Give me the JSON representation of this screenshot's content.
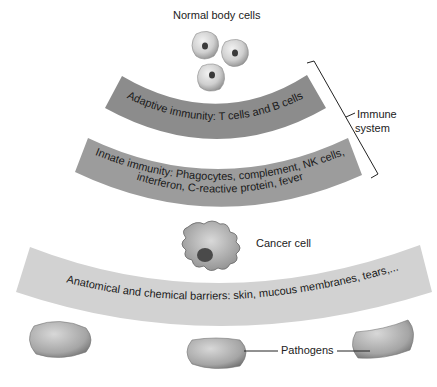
{
  "labels": {
    "normal_cells": "Normal body cells",
    "immune_system_line1": "Immune",
    "immune_system_line2": "system",
    "cancer_cell": "Cancer cell",
    "pathogens": "Pathogens"
  },
  "bands": [
    {
      "id": "adaptive",
      "lines": [
        "Adaptive immunity: T cells and B cells"
      ],
      "color": "#8a8a8a"
    },
    {
      "id": "innate",
      "lines": [
        "Innate immunity: Phagocytes, complement, NK cells,",
        "interferon, C-reactive protein, fever"
      ],
      "color": "#9a9a9a"
    },
    {
      "id": "barriers",
      "lines": [
        "Anatomical and chemical barriers: skin, mucous membranes, tears,..."
      ],
      "color": "#cfcfcf"
    }
  ],
  "colors": {
    "cell": "#c8c8c8",
    "pathogen": "#a8a8a8",
    "line": "#222222"
  }
}
